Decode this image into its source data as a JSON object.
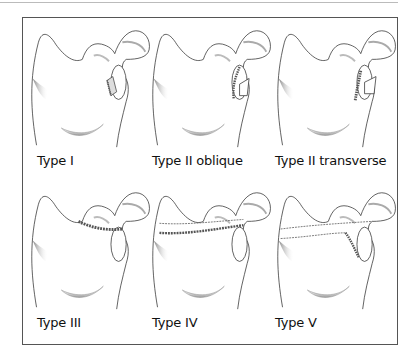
{
  "figure": {
    "panels": [
      {
        "label": "Type I",
        "fracture": "anterior-rim"
      },
      {
        "label": "Type II oblique",
        "fracture": "inferior-oblique"
      },
      {
        "label": "Type II transverse",
        "fracture": "inferior-transverse"
      },
      {
        "label": "Type III",
        "fracture": "superior"
      },
      {
        "label": "Type IV",
        "fracture": "transverse-body"
      },
      {
        "label": "Type V",
        "fracture": "combined"
      }
    ]
  },
  "colors": {
    "line": "#333333",
    "shade": "#9a9a9a",
    "fracture": "#555555",
    "frame": "#555555"
  }
}
